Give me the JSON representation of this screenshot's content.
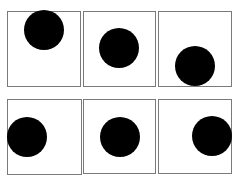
{
  "diagram": {
    "title": "",
    "colors": {
      "background": "#ffffff",
      "frame": "#7a7a7a",
      "dot": "#000000"
    },
    "panels": [
      {
        "id": "panel-1",
        "box": [
          7,
          11,
          74,
          76
        ],
        "dot": {
          "cx": 44,
          "cy": 30,
          "r": 20
        }
      },
      {
        "id": "panel-2",
        "box": [
          83,
          11,
          73,
          76
        ],
        "dot": {
          "cx": 119,
          "cy": 48,
          "r": 20
        }
      },
      {
        "id": "panel-3",
        "box": [
          158,
          11,
          74,
          76
        ],
        "dot": {
          "cx": 195,
          "cy": 66,
          "r": 20
        }
      },
      {
        "id": "panel-4",
        "box": [
          7,
          99,
          75,
          76
        ],
        "dot": {
          "cx": 27,
          "cy": 137,
          "r": 20
        }
      },
      {
        "id": "panel-5",
        "box": [
          83,
          99,
          73,
          75
        ],
        "dot": {
          "cx": 120,
          "cy": 137,
          "r": 20
        }
      },
      {
        "id": "panel-6",
        "box": [
          158,
          99,
          74,
          75
        ],
        "dot": {
          "cx": 212,
          "cy": 136,
          "r": 20
        }
      }
    ]
  }
}
